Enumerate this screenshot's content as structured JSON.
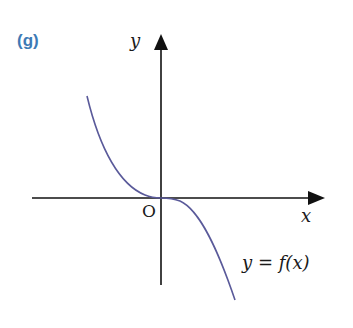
{
  "figure": {
    "part_label": "(g)",
    "part_label_color": "#3d7ab5",
    "y_axis_label": "y",
    "x_axis_label": "x",
    "origin_label": "O",
    "curve_label": "y = f(x)",
    "curve_color": "#5a5a9a",
    "axis_color": "#111111"
  }
}
